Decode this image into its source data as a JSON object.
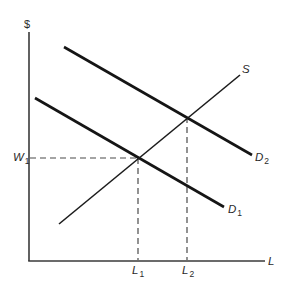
{
  "diagram": {
    "type": "supply-demand (labor market)",
    "y_axis": {
      "label": "$"
    },
    "x_axis": {
      "label": "L"
    },
    "curves": [
      {
        "id": "D1",
        "label": "D",
        "subscript": "1",
        "kind": "demand"
      },
      {
        "id": "D2",
        "label": "D",
        "subscript": "2",
        "kind": "demand"
      },
      {
        "id": "S",
        "label": "S",
        "kind": "supply"
      }
    ],
    "markers": {
      "wage": {
        "label": "W",
        "subscript": "1"
      },
      "quantity_1": {
        "label": "L",
        "subscript": "1"
      },
      "quantity_2": {
        "label": "L",
        "subscript": "2"
      }
    },
    "colors": {
      "background": "#ffffff",
      "lines": "#151515",
      "axes": "#3a3a3a"
    }
  }
}
